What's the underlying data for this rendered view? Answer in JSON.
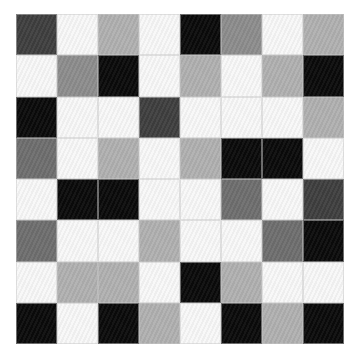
{
  "image": {
    "description": "8x8 grid of grayscale squares in varying tones (black, dark gray, mid gray, light gray, white)",
    "rows": 8,
    "cols": 8,
    "palette": {
      "W": "#f8f8f8",
      "K": "#0a0a0a",
      "D": "#3e3e3e",
      "M": "#6e6e6e",
      "G": "#8c8c8c",
      "L": "#b0b0b0"
    },
    "grid": [
      [
        "D",
        "W",
        "L",
        "W",
        "K",
        "G",
        "W",
        "L"
      ],
      [
        "W",
        "G",
        "K",
        "W",
        "L",
        "W",
        "L",
        "K"
      ],
      [
        "K",
        "W",
        "W",
        "D",
        "W",
        "W",
        "W",
        "L"
      ],
      [
        "M",
        "W",
        "L",
        "W",
        "L",
        "K",
        "K",
        "W"
      ],
      [
        "W",
        "K",
        "K",
        "W",
        "W",
        "M",
        "W",
        "D"
      ],
      [
        "M",
        "W",
        "W",
        "L",
        "W",
        "W",
        "M",
        "K"
      ],
      [
        "W",
        "L",
        "L",
        "W",
        "K",
        "L",
        "W",
        "W"
      ],
      [
        "K",
        "W",
        "K",
        "L",
        "W",
        "K",
        "L",
        "K"
      ]
    ]
  }
}
